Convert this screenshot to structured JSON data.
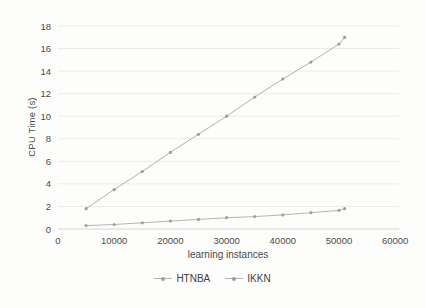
{
  "chart_data": {
    "type": "line",
    "title": "",
    "xlabel": "learning instances",
    "ylabel": "CPU Time (s)",
    "x": [
      5000,
      10000,
      15000,
      20000,
      25000,
      30000,
      35000,
      40000,
      45000,
      50000,
      51000
    ],
    "series": [
      {
        "name": "HTNBA",
        "color": "#b5b7b6",
        "marker_color": "#a0a2a1",
        "values": [
          0.3,
          0.4,
          0.55,
          0.7,
          0.85,
          1.0,
          1.1,
          1.25,
          1.45,
          1.65,
          1.8
        ]
      },
      {
        "name": "IKKN",
        "color": "#b0b2b1",
        "marker_color": "#9b9d9c",
        "values": [
          1.8,
          3.5,
          5.1,
          6.8,
          8.4,
          10.0,
          11.7,
          13.3,
          14.8,
          16.4,
          17.0
        ]
      }
    ],
    "xlim": [
      0,
      60000
    ],
    "ylim": [
      0,
      18
    ],
    "x_ticks": [
      0,
      10000,
      20000,
      30000,
      40000,
      50000,
      60000
    ],
    "y_ticks": [
      0,
      2,
      4,
      6,
      8,
      10,
      12,
      14,
      16,
      18
    ],
    "grid": true,
    "legend_position": "bottom"
  },
  "colors": {
    "background": "#fdfdfc",
    "gridline": "#ebebe9",
    "axis_line": "#d6d6d4",
    "tick_label": "#4a4a4a",
    "legend_text": "#3f3f3f"
  }
}
